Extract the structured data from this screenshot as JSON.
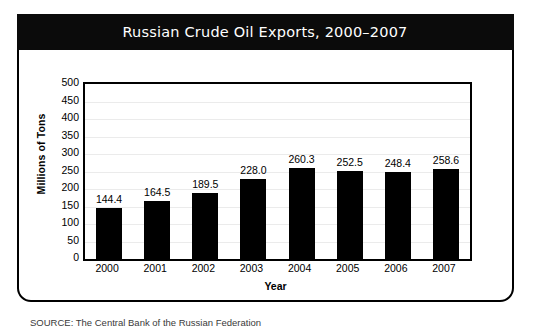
{
  "card": {
    "title": "Russian Crude Oil Exports, 2000–2007",
    "source_note": "SOURCE: The Central Bank of the Russian Federation"
  },
  "colors": {
    "banner_background": "#0b0b0b",
    "banner_text": "#ffffff",
    "bar": "#000000",
    "axis": "#000000",
    "gridline": "#ebebeb",
    "plot_background": "#ffffff"
  },
  "chart_data": {
    "type": "bar",
    "title": "Russian Crude Oil Exports, 2000–2007",
    "xlabel": "Year",
    "ylabel": "Millions of Tons",
    "categories": [
      "2000",
      "2001",
      "2002",
      "2003",
      "2004",
      "2005",
      "2006",
      "2007"
    ],
    "values": [
      144.4,
      164.5,
      189.5,
      228.0,
      260.3,
      252.5,
      248.4,
      258.6
    ],
    "value_labels": [
      "144.4",
      "164.5",
      "189.5",
      "228.0",
      "260.3",
      "252.5",
      "248.4",
      "258.6"
    ],
    "ylim": [
      0,
      500
    ],
    "ytick_step": 50,
    "yticks": [
      500,
      450,
      400,
      350,
      300,
      250,
      200,
      150,
      100,
      50,
      0
    ],
    "ytick_labels": [
      "500",
      "450",
      "400",
      "350",
      "300",
      "250",
      "200",
      "150",
      "100",
      "50",
      "0"
    ],
    "grid": true,
    "legend": false,
    "legend_position": "none",
    "annotations": [
      "SOURCE: The Central Bank of the Russian Federation"
    ]
  }
}
